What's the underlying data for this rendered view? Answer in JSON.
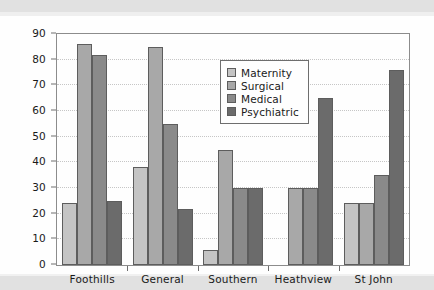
{
  "chart_data": {
    "type": "bar",
    "title": "",
    "xlabel": "",
    "ylabel": "",
    "ylim": [
      0,
      90
    ],
    "ytick_step": 10,
    "yticks": [
      0,
      10,
      20,
      30,
      40,
      50,
      60,
      70,
      80,
      90
    ],
    "grid": true,
    "legend_position": "upper center",
    "categories": [
      "Foothills",
      "General",
      "Southern",
      "Heathview",
      "St John"
    ],
    "series": [
      {
        "name": "Maternity",
        "color": "#c4c4c4",
        "values": [
          24,
          38,
          6,
          0,
          24
        ]
      },
      {
        "name": "Surgical",
        "color": "#a8a8a8",
        "values": [
          86,
          85,
          45,
          30,
          24
        ]
      },
      {
        "name": "Medical",
        "color": "#8a8a8a",
        "values": [
          82,
          55,
          30,
          30,
          35
        ]
      },
      {
        "name": "Psychiatric",
        "color": "#6b6b6b",
        "values": [
          25,
          22,
          30,
          65,
          76
        ]
      }
    ]
  },
  "legend": {
    "items": [
      {
        "label": "Maternity"
      },
      {
        "label": "Surgical"
      },
      {
        "label": "Medical"
      },
      {
        "label": "Psychiatric"
      }
    ]
  }
}
